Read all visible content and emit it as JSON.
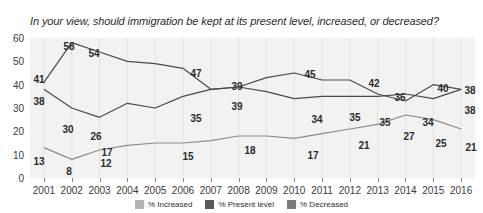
{
  "chart_data": {
    "type": "line",
    "title": "In your view, should immigration be kept at its present level, increased, or decreased?",
    "xlabel": "",
    "ylabel": "",
    "ylim": [
      0,
      60
    ],
    "yticks": [
      0,
      10,
      20,
      30,
      40,
      50,
      60
    ],
    "grid": "vertical",
    "legend_position": "bottom",
    "categories": [
      "2001",
      "2002",
      "2003",
      "2004",
      "2005",
      "2006",
      "2007",
      "2008",
      "2009",
      "2010",
      "2011",
      "2012",
      "2013",
      "2014",
      "2015",
      "2016"
    ],
    "series": [
      {
        "name": "% Decreased",
        "color": "#4a4a4a",
        "values": [
          41,
          58,
          54,
          50,
          49,
          47,
          38,
          39,
          37,
          34,
          35,
          35,
          35,
          36,
          34,
          38
        ]
      },
      {
        "name": "% Present level",
        "color": "#4a4a4a",
        "values": [
          38,
          30,
          26,
          32,
          30,
          35,
          38,
          39,
          43,
          45,
          42,
          42,
          36,
          33,
          40,
          38
        ]
      },
      {
        "name": "% Increased",
        "color": "#8c8c8c",
        "values": [
          13,
          8,
          12,
          14,
          15,
          15,
          16,
          18,
          18,
          17,
          19,
          21,
          23,
          27,
          25,
          21
        ]
      }
    ],
    "point_labels": [
      {
        "text": "41",
        "series": "% Decreased",
        "year": "2001",
        "x": 39,
        "y": 79
      },
      {
        "text": "58",
        "series": "% Decreased",
        "year": "2002",
        "x": 69,
        "y": 46
      },
      {
        "text": "54",
        "series": "% Decreased",
        "year": "2003",
        "x": 94,
        "y": 53
      },
      {
        "text": "47",
        "series": "% Decreased",
        "year": "2006",
        "x": 196,
        "y": 73
      },
      {
        "text": "39",
        "series": "% Decreased",
        "year": "2008",
        "x": 237,
        "y": 86
      },
      {
        "text": "34",
        "series": "% Decreased",
        "year": "2010",
        "x": 317,
        "y": 119
      },
      {
        "text": "35",
        "series": "% Decreased",
        "year": "2011",
        "x": 355,
        "y": 117
      },
      {
        "text": "35",
        "series": "% Decreased",
        "year": "2012",
        "x": 385,
        "y": 122
      },
      {
        "text": "34",
        "series": "% Decreased",
        "year": "2014",
        "x": 428,
        "y": 122
      },
      {
        "text": "38",
        "series": "% Decreased",
        "year": "2016",
        "x": 470,
        "y": 110
      },
      {
        "text": "38",
        "series": "% Present level",
        "year": "2001",
        "x": 39,
        "y": 101
      },
      {
        "text": "30",
        "series": "% Present level",
        "year": "2002",
        "x": 68,
        "y": 129
      },
      {
        "text": "26",
        "series": "% Present level",
        "year": "2003",
        "x": 96,
        "y": 136
      },
      {
        "text": "35",
        "series": "% Present level",
        "year": "2006",
        "x": 196,
        "y": 118
      },
      {
        "text": "39",
        "series": "% Present level",
        "year": "2008",
        "x": 237,
        "y": 106
      },
      {
        "text": "45",
        "series": "% Present level",
        "year": "2010",
        "x": 310,
        "y": 74
      },
      {
        "text": "42",
        "series": "% Present level",
        "year": "2012",
        "x": 374,
        "y": 83
      },
      {
        "text": "36",
        "series": "% Present level",
        "year": "2013",
        "x": 400,
        "y": 97
      },
      {
        "text": "40",
        "series": "% Present level",
        "year": "2015",
        "x": 443,
        "y": 88
      },
      {
        "text": "38",
        "series": "% Present level",
        "year": "2016",
        "x": 470,
        "y": 90
      },
      {
        "text": "13",
        "series": "% Increased",
        "year": "2001",
        "x": 39,
        "y": 161
      },
      {
        "text": "8",
        "series": "% Increased",
        "year": "2002",
        "x": 69,
        "y": 171
      },
      {
        "text": "17",
        "series": "% Increased",
        "year": "2003",
        "x": 107,
        "y": 152
      },
      {
        "text": "12",
        "series": "% Increased",
        "year": "2003",
        "x": 106,
        "y": 163
      },
      {
        "text": "15",
        "series": "% Increased",
        "year": "2006",
        "x": 188,
        "y": 156
      },
      {
        "text": "18",
        "series": "% Increased",
        "year": "2008",
        "x": 250,
        "y": 150
      },
      {
        "text": "17",
        "series": "% Increased",
        "year": "2010",
        "x": 313,
        "y": 155
      },
      {
        "text": "21",
        "series": "% Increased",
        "year": "2012",
        "x": 364,
        "y": 145
      },
      {
        "text": "27",
        "series": "% Increased",
        "year": "2014",
        "x": 409,
        "y": 136
      },
      {
        "text": "25",
        "series": "% Increased",
        "year": "2015",
        "x": 441,
        "y": 143
      },
      {
        "text": "21",
        "series": "% Increased",
        "year": "2016",
        "x": 471,
        "y": 147
      }
    ]
  },
  "legend": {
    "items": [
      {
        "label": "% Increased",
        "color": "#b3b3b3"
      },
      {
        "label": "% Present level",
        "color": "#595959"
      },
      {
        "label": "% Decreased",
        "color": "#7a7a7a"
      }
    ]
  }
}
